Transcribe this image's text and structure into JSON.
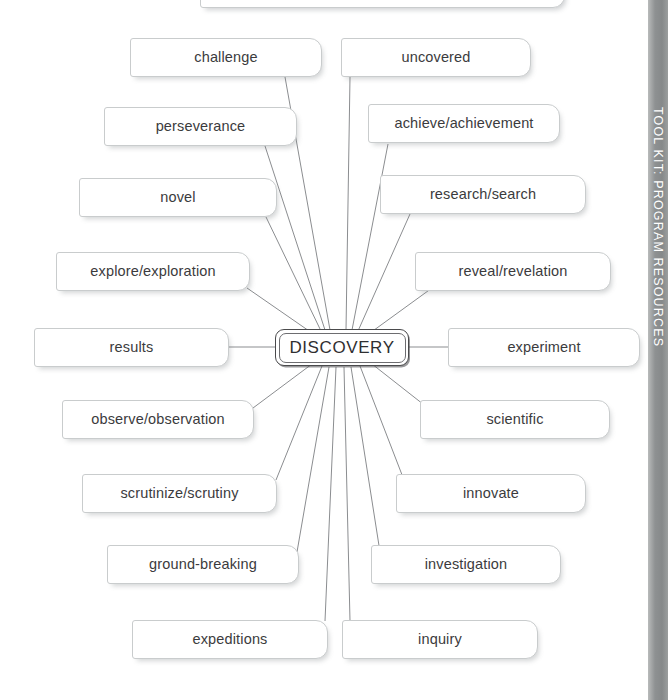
{
  "page": {
    "background_color": "#ffffff"
  },
  "side_tab": {
    "label": "TOOL KIT: PROGRAM RESOURCES",
    "background_color": "#8e9192",
    "text_color": "#ffffff"
  },
  "center": {
    "label": "DISCOVERY",
    "border_color": "#4a4a4c"
  },
  "nodes": [
    {
      "label": "challenge",
      "x": 130,
      "y": 38,
      "w": 192
    },
    {
      "label": "uncovered",
      "x": 341,
      "y": 38,
      "w": 190
    },
    {
      "label": "perseverance",
      "x": 104,
      "y": 107,
      "w": 193
    },
    {
      "label": "achieve/achievement",
      "x": 368,
      "y": 104,
      "w": 192
    },
    {
      "label": "novel",
      "x": 79,
      "y": 178,
      "w": 198
    },
    {
      "label": "research/search",
      "x": 380,
      "y": 175,
      "w": 206
    },
    {
      "label": "explore/exploration",
      "x": 56,
      "y": 252,
      "w": 194
    },
    {
      "label": "reveal/revelation",
      "x": 415,
      "y": 252,
      "w": 196
    },
    {
      "label": "results",
      "x": 34,
      "y": 328,
      "w": 195
    },
    {
      "label": "experiment",
      "x": 448,
      "y": 328,
      "w": 192
    },
    {
      "label": "observe/observation",
      "x": 62,
      "y": 400,
      "w": 192
    },
    {
      "label": "scientific",
      "x": 420,
      "y": 400,
      "w": 190
    },
    {
      "label": "scrutinize/scrutiny",
      "x": 82,
      "y": 474,
      "w": 195
    },
    {
      "label": "innovate",
      "x": 396,
      "y": 474,
      "w": 190
    },
    {
      "label": "ground-breaking",
      "x": 107,
      "y": 545,
      "w": 192
    },
    {
      "label": "investigation",
      "x": 371,
      "y": 545,
      "w": 190
    },
    {
      "label": "expeditions",
      "x": 132,
      "y": 620,
      "w": 196
    },
    {
      "label": "inquiry",
      "x": 342,
      "y": 620,
      "w": 196
    }
  ],
  "connectors": {
    "stroke_color": "#8b8d90",
    "stroke_width": 1,
    "hub": {
      "x": 342,
      "y": 347
    },
    "lines": [
      {
        "from_node": "challenge",
        "x1": 285,
        "y1": 77,
        "x2": 330,
        "y2": 330
      },
      {
        "from_node": "uncovered",
        "x1": 350,
        "y1": 77,
        "x2": 346,
        "y2": 330
      },
      {
        "from_node": "perseverance",
        "x1": 265,
        "y1": 146,
        "x2": 325,
        "y2": 330
      },
      {
        "from_node": "achieve/achievement",
        "x1": 388,
        "y1": 144,
        "x2": 352,
        "y2": 330
      },
      {
        "from_node": "novel",
        "x1": 266,
        "y1": 217,
        "x2": 321,
        "y2": 331
      },
      {
        "from_node": "research/search",
        "x1": 410,
        "y1": 214,
        "x2": 358,
        "y2": 331
      },
      {
        "from_node": "explore/exploration",
        "x1": 247,
        "y1": 288,
        "x2": 312,
        "y2": 333
      },
      {
        "from_node": "reveal/revelation",
        "x1": 432,
        "y1": 288,
        "x2": 370,
        "y2": 333
      },
      {
        "from_node": "results",
        "x1": 229,
        "y1": 347,
        "x2": 275,
        "y2": 347
      },
      {
        "from_node": "experiment",
        "x1": 409,
        "y1": 347,
        "x2": 448,
        "y2": 347
      },
      {
        "from_node": "observe/observation",
        "x1": 253,
        "y1": 408,
        "x2": 312,
        "y2": 364
      },
      {
        "from_node": "scientific",
        "x1": 428,
        "y1": 408,
        "x2": 372,
        "y2": 364
      },
      {
        "from_node": "scrutinize/scrutiny",
        "x1": 276,
        "y1": 480,
        "x2": 322,
        "y2": 366
      },
      {
        "from_node": "innovate",
        "x1": 404,
        "y1": 480,
        "x2": 360,
        "y2": 366
      },
      {
        "from_node": "ground-breaking",
        "x1": 297,
        "y1": 552,
        "x2": 329,
        "y2": 367
      },
      {
        "from_node": "investigation",
        "x1": 380,
        "y1": 552,
        "x2": 351,
        "y2": 367
      },
      {
        "from_node": "expeditions",
        "x1": 325,
        "y1": 621,
        "x2": 336,
        "y2": 367
      },
      {
        "from_node": "inquiry",
        "x1": 350,
        "y1": 621,
        "x2": 344,
        "y2": 367
      }
    ]
  }
}
